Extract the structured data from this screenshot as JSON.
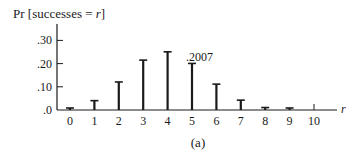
{
  "chart_data": {
    "type": "bar",
    "title": "",
    "ylabel": "Pr [successes = r]",
    "xlabel": "r",
    "caption": "(a)",
    "categories": [
      "0",
      "1",
      "2",
      "3",
      "4",
      "5",
      "6",
      "7",
      "8",
      "9",
      "10"
    ],
    "values": [
      0.006,
      0.0403,
      0.1209,
      0.215,
      0.2508,
      0.2007,
      0.1115,
      0.0425,
      0.0106,
      0.0016,
      0.0001
    ],
    "yticks": [
      0.0,
      0.1,
      0.2,
      0.3
    ],
    "ytick_labels": [
      ".0",
      ".10",
      ".20",
      ".30"
    ],
    "ylim": [
      0,
      0.38
    ],
    "annotations": [
      {
        "category": "5",
        "text": ".2007"
      }
    ],
    "grid": false,
    "legend": null
  }
}
